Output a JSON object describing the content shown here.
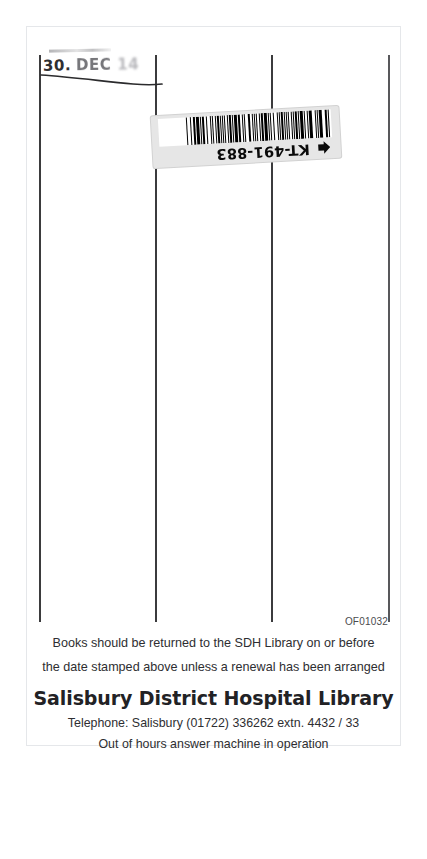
{
  "document": {
    "kind": "library-date-due-slip",
    "reference_code": "OF01032"
  },
  "date_stamp": {
    "day": "30.",
    "month": "DEC",
    "year": "14",
    "note": "struck-through / cancelled"
  },
  "barcode_label": {
    "number": "KT-491-883",
    "arrow_icon": "arrow-pointer-icon",
    "orientation": "upside-down"
  },
  "ruled_columns": {
    "count": 3,
    "rule_positions": [
      12,
      128,
      244,
      361
    ]
  },
  "footer": {
    "notice_line_1": "Books should be returned to the SDH Library on or before",
    "notice_line_2": "the date stamped above unless a renewal has been arranged",
    "library_name": "Salisbury District Hospital Library",
    "telephone": "Telephone: Salisbury (01722) 336262  extn. 4432 / 33",
    "after_hours": "Out of hours answer machine in operation"
  },
  "colors": {
    "paper": "#ffffff",
    "rule": "#3b3b3d",
    "label_bg": "#e6e6e6",
    "ink": "#2e2e31"
  }
}
